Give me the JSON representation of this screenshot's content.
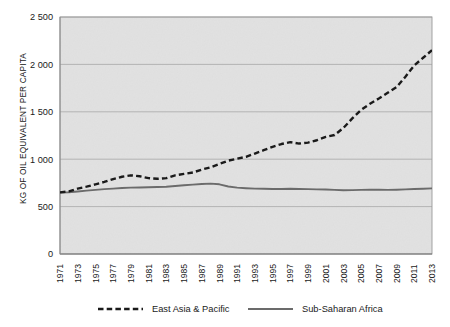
{
  "chart_data": {
    "type": "line",
    "title": "",
    "xlabel": "",
    "ylabel": "KG OF OIL EQUIVALENT PER CAPITA",
    "ylim": [
      0,
      2500
    ],
    "xlim": [
      1971,
      2013
    ],
    "yticks": [
      0,
      500,
      1000,
      1500,
      2000,
      2500
    ],
    "ytick_labels": [
      "0",
      "500",
      "1 000",
      "1 500",
      "2 000",
      "2 500"
    ],
    "grid": true,
    "grid_axis": "y",
    "legend_position": "bottom",
    "x": [
      1971,
      1972,
      1973,
      1974,
      1975,
      1976,
      1977,
      1978,
      1979,
      1980,
      1981,
      1982,
      1983,
      1984,
      1985,
      1986,
      1987,
      1988,
      1989,
      1990,
      1991,
      1992,
      1993,
      1994,
      1995,
      1996,
      1997,
      1998,
      1999,
      2000,
      2001,
      2002,
      2003,
      2004,
      2005,
      2006,
      2007,
      2008,
      2009,
      2010,
      2011,
      2012,
      2013
    ],
    "xtick_labels": [
      "1971",
      "1973",
      "1975",
      "1977",
      "1979",
      "1981",
      "1983",
      "1985",
      "1987",
      "1989",
      "1991",
      "1993",
      "1995",
      "1997",
      "1999",
      "2001",
      "2003",
      "2005",
      "2007",
      "2009",
      "2011",
      "2013"
    ],
    "series": [
      {
        "name": "East Asia & Pacific",
        "style": "dashed",
        "color": "#1a1a1a",
        "values": [
          650,
          660,
          690,
          710,
          735,
          760,
          790,
          815,
          830,
          820,
          800,
          793,
          800,
          830,
          845,
          860,
          890,
          915,
          950,
          985,
          1005,
          1025,
          1060,
          1095,
          1130,
          1160,
          1180,
          1165,
          1175,
          1200,
          1235,
          1255,
          1330,
          1430,
          1520,
          1585,
          1640,
          1700,
          1760,
          1870,
          1990,
          2070,
          2150
        ]
      },
      {
        "name": "Sub-Saharan Africa",
        "style": "solid",
        "color": "#6b6b6b",
        "values": [
          648,
          652,
          660,
          668,
          676,
          684,
          690,
          696,
          700,
          702,
          704,
          706,
          710,
          718,
          726,
          732,
          738,
          742,
          735,
          712,
          700,
          694,
          690,
          688,
          686,
          686,
          688,
          686,
          684,
          682,
          680,
          676,
          672,
          674,
          676,
          678,
          678,
          676,
          678,
          682,
          686,
          688,
          692
        ]
      }
    ]
  },
  "legend": {
    "items": [
      {
        "label": "East Asia & Pacific",
        "style": "dashed"
      },
      {
        "label": "Sub-Saharan Africa",
        "style": "solid"
      }
    ]
  },
  "colors": {
    "plot_background": "#e9e9e9",
    "gridline": "#a8a8a8",
    "frame": "#9a9a9a",
    "series_dashed": "#1a1a1a",
    "series_solid": "#6b6b6b",
    "text": "#1a1a1a"
  }
}
